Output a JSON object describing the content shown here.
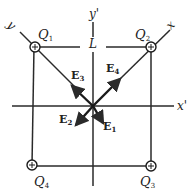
{
  "diagram": {
    "colors": {
      "line": "#2a2a2a",
      "background": "#ffffff"
    },
    "axes": {
      "x_prime": {
        "label": "x",
        "prime": "'"
      },
      "y_prime": {
        "label": "y",
        "prime": "'"
      },
      "x_diag": {
        "label": "x"
      },
      "y_diag": {
        "label": "y"
      }
    },
    "side_label": "L",
    "charges": [
      {
        "name": "Q",
        "sub": "1",
        "sign": "+"
      },
      {
        "name": "Q",
        "sub": "2",
        "sign": "+"
      },
      {
        "name": "Q",
        "sub": "3",
        "sign": "+"
      },
      {
        "name": "Q",
        "sub": "4",
        "sign": "+"
      }
    ],
    "vectors": [
      {
        "name": "E",
        "sub": "1"
      },
      {
        "name": "E",
        "sub": "2"
      },
      {
        "name": "E",
        "sub": "3"
      },
      {
        "name": "E",
        "sub": "4"
      }
    ]
  }
}
